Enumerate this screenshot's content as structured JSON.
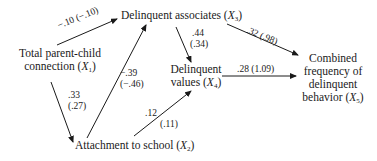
{
  "diagram": {
    "type": "path-diagram",
    "nodes": {
      "x1": {
        "line1": "Total parent-child",
        "line2_text": "connection (",
        "var": "X",
        "sub": "1",
        "close": ")"
      },
      "x2": {
        "line1_text": "Attachment to school (",
        "var": "X",
        "sub": "2",
        "close": ")"
      },
      "x3": {
        "line1_text": "Delinquent associates (",
        "var": "X",
        "sub": "3",
        "close": ")"
      },
      "x4": {
        "line1": "Delinquent",
        "line2_text": "values (",
        "var": "X",
        "sub": "4",
        "close": ")"
      },
      "x5": {
        "line1": "Combined",
        "line2": "frequency of",
        "line3": "delinquent",
        "line4_text": "behavior (",
        "var": "X",
        "sub": "5",
        "close": ")"
      }
    },
    "paths": [
      {
        "from": "X1",
        "to": "X3",
        "label": "−.10 (−.10)"
      },
      {
        "from": "X1",
        "to": "X2",
        "coef": ".33",
        "unstd": "(.27)"
      },
      {
        "from": "X2",
        "to": "X3",
        "coef": "−.39",
        "unstd": "(−.46)"
      },
      {
        "from": "X2",
        "to": "X4",
        "coef": ".12",
        "unstd": "(.11)"
      },
      {
        "from": "X3",
        "to": "X4",
        "coef": ".44",
        "unstd": "(.34)"
      },
      {
        "from": "X3",
        "to": "X5",
        "label": ".32 (.98)"
      },
      {
        "from": "X4",
        "to": "X5",
        "label": ".28 (1.09)"
      }
    ]
  }
}
